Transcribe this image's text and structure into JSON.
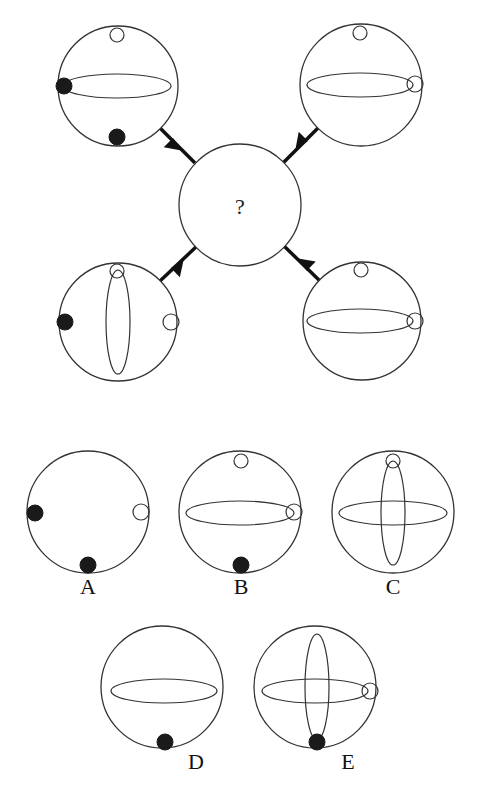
{
  "puzzle": {
    "center_symbol": "?",
    "stroke_color": "#333333",
    "fill_black": "#1a1a1a",
    "background": "#ffffff"
  },
  "top_figures": [
    {
      "position": "top-left",
      "cx": 118,
      "cy": 86,
      "r": 60,
      "elements": [
        {
          "type": "white-dot",
          "x": 117,
          "y": 35,
          "r": 7
        },
        {
          "type": "h-ellipse",
          "cx": 117,
          "cy": 86,
          "rx": 54,
          "ry": 12
        },
        {
          "type": "black-dot",
          "x": 64,
          "y": 86,
          "r": 8
        },
        {
          "type": "black-dot",
          "x": 117,
          "y": 137,
          "r": 8
        }
      ]
    },
    {
      "position": "top-right",
      "cx": 361,
      "cy": 85,
      "r": 61,
      "elements": [
        {
          "type": "white-dot",
          "x": 360,
          "y": 33,
          "r": 7
        },
        {
          "type": "h-ellipse",
          "cx": 360,
          "cy": 85,
          "rx": 53,
          "ry": 12
        },
        {
          "type": "white-dot",
          "x": 415,
          "y": 84,
          "r": 8
        }
      ]
    },
    {
      "position": "bottom-left",
      "cx": 118,
      "cy": 322,
      "r": 59,
      "elements": [
        {
          "type": "white-dot",
          "x": 117,
          "y": 271,
          "r": 7
        },
        {
          "type": "v-ellipse",
          "cx": 118,
          "cy": 322,
          "rx": 12,
          "ry": 52
        },
        {
          "type": "black-dot",
          "x": 65,
          "y": 322,
          "r": 8
        },
        {
          "type": "white-dot",
          "x": 171,
          "y": 322,
          "r": 8
        }
      ]
    },
    {
      "position": "bottom-right",
      "cx": 362,
      "cy": 321,
      "r": 59,
      "elements": [
        {
          "type": "white-dot",
          "x": 361,
          "y": 270,
          "r": 7
        },
        {
          "type": "h-ellipse",
          "cx": 360,
          "cy": 321,
          "rx": 53,
          "ry": 12
        },
        {
          "type": "white-dot",
          "x": 415,
          "y": 321,
          "r": 8
        }
      ]
    }
  ],
  "center_figure": {
    "cx": 240,
    "cy": 205,
    "r": 61
  },
  "options": [
    {
      "label": "A",
      "cx": 88,
      "cy": 512,
      "r": 61,
      "elements": [
        {
          "type": "black-dot",
          "x": 35,
          "y": 513,
          "r": 8
        },
        {
          "type": "white-dot",
          "x": 141,
          "y": 512,
          "r": 8
        },
        {
          "type": "black-dot",
          "x": 88,
          "y": 565,
          "r": 8
        }
      ]
    },
    {
      "label": "B",
      "cx": 240,
      "cy": 512,
      "r": 61,
      "elements": [
        {
          "type": "white-dot",
          "x": 241,
          "y": 461,
          "r": 7
        },
        {
          "type": "h-ellipse",
          "cx": 240,
          "cy": 513,
          "rx": 54,
          "ry": 12
        },
        {
          "type": "white-dot",
          "x": 294,
          "y": 512,
          "r": 8
        },
        {
          "type": "black-dot",
          "x": 241,
          "y": 565,
          "r": 8
        }
      ]
    },
    {
      "label": "C",
      "cx": 393,
      "cy": 512,
      "r": 61,
      "elements": [
        {
          "type": "white-dot",
          "x": 393,
          "y": 461,
          "r": 7
        },
        {
          "type": "h-ellipse",
          "cx": 393,
          "cy": 513,
          "rx": 54,
          "ry": 12
        },
        {
          "type": "v-ellipse",
          "cx": 393,
          "cy": 513,
          "rx": 12,
          "ry": 52
        }
      ]
    },
    {
      "label": "D",
      "cx": 162,
      "cy": 687,
      "r": 61,
      "elements": [
        {
          "type": "h-ellipse",
          "cx": 164,
          "cy": 691,
          "rx": 53,
          "ry": 12
        },
        {
          "type": "black-dot",
          "x": 165,
          "y": 742,
          "r": 8
        }
      ]
    },
    {
      "label": "E",
      "cx": 315,
      "cy": 687,
      "r": 61,
      "elements": [
        {
          "type": "h-ellipse",
          "cx": 315,
          "cy": 691,
          "rx": 53,
          "ry": 12
        },
        {
          "type": "v-ellipse",
          "cx": 317,
          "cy": 687,
          "rx": 12,
          "ry": 53
        },
        {
          "type": "white-dot",
          "x": 370,
          "y": 691,
          "r": 8
        },
        {
          "type": "black-dot",
          "x": 317,
          "y": 742,
          "r": 8
        }
      ]
    }
  ],
  "connectors": [
    {
      "from": "top-left",
      "x1": 160,
      "y1": 128,
      "x2": 195,
      "y2": 163
    },
    {
      "from": "top-right",
      "x1": 318,
      "y1": 128,
      "x2": 283,
      "y2": 163
    },
    {
      "from": "bottom-left",
      "x1": 160,
      "y1": 281,
      "x2": 197,
      "y2": 246
    },
    {
      "from": "bottom-right",
      "x1": 320,
      "y1": 281,
      "x2": 284,
      "y2": 246
    }
  ],
  "option_labels": {
    "A": "A",
    "B": "B",
    "C": "C",
    "D": "D",
    "E": "E"
  }
}
